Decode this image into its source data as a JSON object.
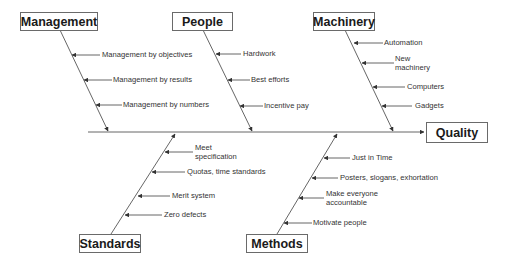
{
  "diagram": {
    "type": "fishbone",
    "effect": "Quality",
    "categories": [
      {
        "name": "Management",
        "position": "top",
        "causes": [
          "Management by objectives",
          "Management by results",
          "Management by numbers"
        ]
      },
      {
        "name": "People",
        "position": "top",
        "causes": [
          "Hardwork",
          "Best efforts",
          "Incentive pay"
        ]
      },
      {
        "name": "Machinery",
        "position": "top",
        "causes": [
          "Automation",
          "New machinery",
          "Computers",
          "Gadgets"
        ]
      },
      {
        "name": "Standards",
        "position": "bottom",
        "causes": [
          "Meet specification",
          "Quotas, time standards",
          "Merit system",
          "Zero defects"
        ]
      },
      {
        "name": "Methods",
        "position": "bottom",
        "causes": [
          "Just in Time",
          "Posters, slogans, exhortation",
          "Make everyone accountable",
          "Motivate people"
        ]
      }
    ]
  },
  "labels": {
    "effect": "Quality",
    "management": "Management",
    "people": "People",
    "machinery": "Machinery",
    "standards": "Standards",
    "methods": "Methods",
    "mgmt_1": "Management by objectives",
    "mgmt_2": "Management by results",
    "mgmt_3": "Management by numbers",
    "people_1": "Hardwork",
    "people_2": "Best efforts",
    "people_3": "Incentive pay",
    "mach_1": "Automation",
    "mach_2a": "New",
    "mach_2b": "machinery",
    "mach_3": "Computers",
    "mach_4": "Gadgets",
    "std_1a": "Meet",
    "std_1b": "specification",
    "std_2": "Quotas, time standards",
    "std_3": "Merit system",
    "std_4": "Zero defects",
    "meth_1": "Just in Time",
    "meth_2": "Posters, slogans, exhortation",
    "meth_3a": "Make everyone",
    "meth_3b": "accountable",
    "meth_4": "Motivate people"
  },
  "colors": {
    "line": "#4a4a4a",
    "box_border": "#6a6a6a",
    "text": "#333333",
    "background": "#ffffff"
  }
}
